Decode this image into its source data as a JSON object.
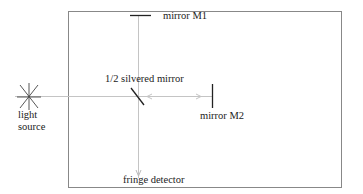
{
  "diagram": {
    "labels": {
      "mirror_m1": "mirror  M1",
      "mirror_m2": "mirror  M2",
      "beam_splitter": "1/2 silvered mirror",
      "light_source_line1": "light",
      "light_source_line2": "source",
      "detector": "fringe detector"
    },
    "colors": {
      "frame": "#777777",
      "beam": "#bbbbbb",
      "optics": "#222222",
      "text": "#222222"
    }
  }
}
